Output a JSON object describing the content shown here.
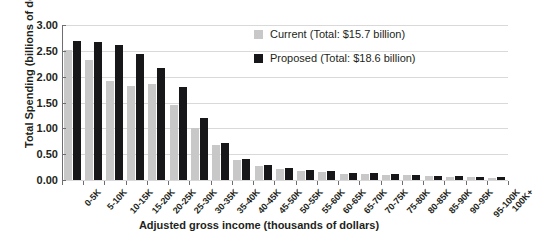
{
  "chart_data": {
    "type": "bar",
    "title": "",
    "xlabel": "Adjusted gross income (thousands of dollars)",
    "ylabel": "Total Spending (billions of dollars)",
    "ylim": [
      0,
      3.0
    ],
    "yticks": [
      "0.00",
      "0.50",
      "1.00",
      "1.50",
      "2.00",
      "2.50",
      "3.00"
    ],
    "ytick_values": [
      0,
      0.5,
      1.0,
      1.5,
      2.0,
      2.5,
      3.0
    ],
    "grid": true,
    "legend_position": "top-right",
    "categories": [
      "0-5K",
      "5-10K",
      "10-15K",
      "15-20K",
      "20-25K",
      "25-30K",
      "30-35K",
      "35-40K",
      "40-45K",
      "45-50K",
      "50-55K",
      "55-60K",
      "60-65K",
      "65-70K",
      "70-75K",
      "75-80K",
      "80-85K",
      "85-90K",
      "90-95K",
      "95-100K",
      "100K+"
    ],
    "series": [
      {
        "name": "Current (Total: $15.7 billion)",
        "color": "#c8c8c8",
        "values": [
          2.52,
          2.33,
          1.92,
          1.82,
          1.86,
          1.46,
          1.0,
          0.68,
          0.38,
          0.27,
          0.22,
          0.18,
          0.15,
          0.12,
          0.11,
          0.1,
          0.09,
          0.07,
          0.06,
          0.05,
          0.04
        ]
      },
      {
        "name": "Proposed (Total: $18.6 billion)",
        "color": "#17171a",
        "values": [
          2.7,
          2.68,
          2.61,
          2.43,
          2.17,
          1.8,
          1.2,
          0.72,
          0.41,
          0.3,
          0.24,
          0.2,
          0.17,
          0.14,
          0.13,
          0.12,
          0.1,
          0.08,
          0.07,
          0.06,
          0.05
        ]
      }
    ]
  },
  "legend": {
    "items": [
      {
        "label": "Current (Total: $15.7 billion)",
        "color": "#c8c8c8"
      },
      {
        "label": "Proposed (Total: $18.6 billion)",
        "color": "#17171a"
      }
    ]
  },
  "axes": {
    "y_title": "Total Spending (billions of dollars)",
    "x_title": "Adjusted gross income (thousands of dollars)"
  }
}
